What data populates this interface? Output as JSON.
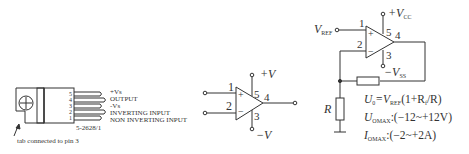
{
  "package": {
    "pins": [
      "5",
      "4",
      "3",
      "2",
      "1"
    ],
    "pin_labels": [
      "+Vs",
      "OUTPUT",
      "-Vs",
      "INVERTING INPUT",
      "NON INVERTING INPUT"
    ],
    "part_code": "5-2628/1",
    "tab_note": "tab connected to pin 3"
  },
  "opamp_symbol": {
    "pin1": "1",
    "pin2": "2",
    "pin3": "3",
    "pin4": "4",
    "pin5": "5",
    "plus": "+",
    "minus": "−",
    "vplus": "+V",
    "vminus": "−V"
  },
  "circuit": {
    "vref": "V",
    "vref_sub": "REF",
    "pin1": "1",
    "pin2": "2",
    "pin3": "3",
    "pin4": "4",
    "pin5": "5",
    "plus": "+",
    "minus": "−",
    "vcc_pos": "+V",
    "vcc_pos_sub": "CC",
    "vcc_neg": "−V",
    "vcc_neg_sub": "SS",
    "resistor": "R",
    "eq1_a": "U",
    "eq1_a_sub": "0",
    "eq1_b": "=V",
    "eq1_b_sub": "REF",
    "eq1_c": "(1+R",
    "eq1_c_sub": "f",
    "eq1_d": "/R)",
    "eq2_a": "U",
    "eq2_a_sub": "OMAX",
    "eq2_b": ":(−12~+12V)",
    "eq3_a": "I",
    "eq3_a_sub": "OMAX",
    "eq3_b": ":(−2~+2A)"
  }
}
